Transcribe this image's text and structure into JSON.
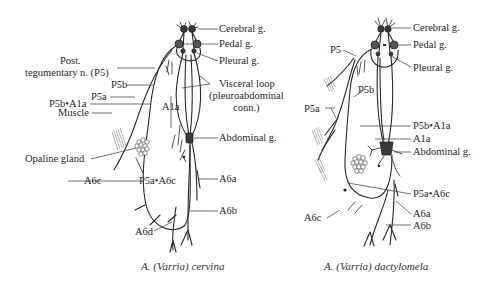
{
  "figure": {
    "left_panel": {
      "caption_genus": "A. (",
      "caption_subgenus": "Varria",
      "caption_species": ") cervina",
      "labels": {
        "cerebral": "Cerebral g.",
        "pedal": "Pedal g.",
        "pleural": "Pleural g.",
        "post_teg_1": "Post.",
        "post_teg_2": "tegumentary n. (P5)",
        "p5b": "P5b",
        "p5a": "P5a",
        "p5b_a1a": "P5b•A1a",
        "muscle": "Muscle",
        "opaline": "Opaline gland",
        "a1a": "A1a",
        "visceral_1": "Visceral loop",
        "visceral_2": "(pleuroabdominal",
        "visceral_3": "conn.)",
        "abdominal": "Abdominal g.",
        "a6c": "A6c",
        "p5a_a6c": "P5a•A6c",
        "a6a": "A6a",
        "a6b": "A6b",
        "a6d": "A6d"
      }
    },
    "right_panel": {
      "caption_genus": "A. (",
      "caption_subgenus": "Varria",
      "caption_species": ") dactylomela",
      "labels": {
        "cerebral": "Cerebral g.",
        "pedal": "Pedal g.",
        "pleural": "Pleural g.",
        "p5": "P5",
        "p5b": "P5b",
        "p5a": "P5a",
        "p5b_a1a": "P5b•A1a",
        "a1a": "A1a",
        "abdominal": "Abdominal g.",
        "p5a_a6c": "P5a•A6c",
        "a6c": "A6c",
        "a6a": "A6a",
        "a6b": "A6b"
      }
    }
  }
}
